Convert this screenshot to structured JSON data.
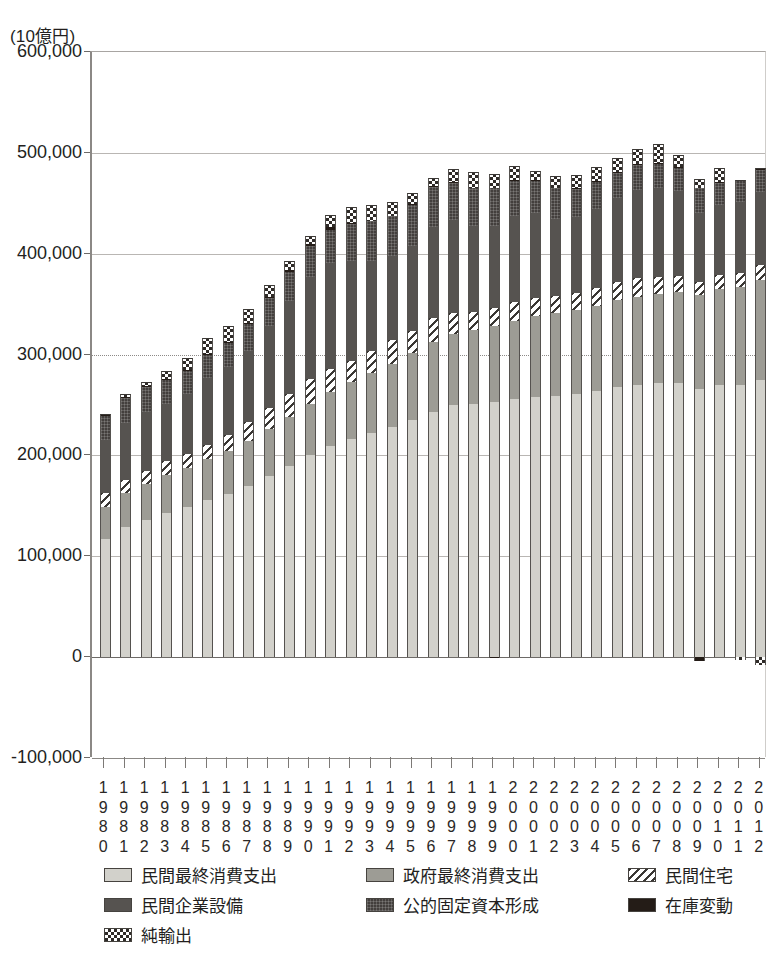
{
  "unit_label": "(10億円)",
  "axis": {
    "y_ticks": [
      "600,000",
      "500,000",
      "400,000",
      "300,000",
      "200,000",
      "100,000",
      "0",
      "-100,000"
    ],
    "y_min": -100000,
    "y_max": 600000,
    "y_step": 100000
  },
  "legend": {
    "items": [
      {
        "key": "private_consumption",
        "label": "民間最終消費支出",
        "swatch": "f-pc",
        "color": "#d2d1cb"
      },
      {
        "key": "government_consumption",
        "label": "政府最終消費支出",
        "swatch": "f-gc",
        "color": "#9d9c95"
      },
      {
        "key": "private_housing",
        "label": "民間住宅",
        "swatch": "f-ph",
        "color": "#3a3734"
      },
      {
        "key": "private_business_investment",
        "label": "民間企業設備",
        "swatch": "f-pi",
        "color": "#565350"
      },
      {
        "key": "public_fixed_capital",
        "label": "公的固定資本形成",
        "swatch": "f-pg",
        "color": "#433f3d"
      },
      {
        "key": "inventory_change",
        "label": "在庫変動",
        "swatch": "f-iv",
        "color": "#241c17"
      },
      {
        "key": "net_exports",
        "label": "純輸出",
        "swatch": "f-nx",
        "color": "#2f2b28"
      }
    ]
  },
  "chart_data": {
    "type": "bar",
    "stacked": true,
    "title": "",
    "xlabel": "",
    "ylabel": "(10億円)",
    "ylim": [
      -100000,
      600000
    ],
    "grid": true,
    "legend_position": "bottom",
    "categories": [
      "1980",
      "1981",
      "1982",
      "1983",
      "1984",
      "1985",
      "1986",
      "1987",
      "1988",
      "1989",
      "1990",
      "1991",
      "1992",
      "1993",
      "1994",
      "1995",
      "1996",
      "1997",
      "1998",
      "1999",
      "2000",
      "2001",
      "2002",
      "2003",
      "2004",
      "2005",
      "2006",
      "2007",
      "2008",
      "2009",
      "2010",
      "2011",
      "2012"
    ],
    "series": [
      {
        "name": "民間最終消費支出",
        "key": "private_consumption",
        "values": [
          117000,
          129000,
          136000,
          143000,
          149000,
          156000,
          162000,
          170000,
          180000,
          190000,
          200000,
          209000,
          216000,
          222000,
          228000,
          235000,
          243000,
          250000,
          251000,
          253000,
          256000,
          258000,
          259000,
          261000,
          264000,
          268000,
          270000,
          272000,
          272000,
          266000,
          270000,
          270000,
          275000
        ]
      },
      {
        "name": "政府最終消費支出",
        "key": "government_consumption",
        "values": [
          32000,
          34000,
          36000,
          38000,
          39000,
          40000,
          42000,
          44000,
          46000,
          48000,
          51000,
          54000,
          57000,
          60000,
          63000,
          67000,
          69000,
          70000,
          73000,
          75000,
          77000,
          80000,
          82000,
          83000,
          84000,
          86000,
          87000,
          88000,
          90000,
          93000,
          95000,
          97000,
          99000
        ]
      },
      {
        "name": "民間住宅",
        "key": "private_housing",
        "values": [
          14000,
          13000,
          13000,
          13000,
          13000,
          14000,
          16000,
          19000,
          21000,
          23000,
          25000,
          23000,
          21000,
          22000,
          23000,
          21000,
          24000,
          21000,
          18000,
          18000,
          19000,
          18000,
          17000,
          17000,
          18000,
          18000,
          19000,
          17000,
          16000,
          13000,
          14000,
          14000,
          15000
        ]
      },
      {
        "name": "民間企業設備",
        "key": "private_business_investment",
        "values": [
          52000,
          56000,
          58000,
          57000,
          60000,
          67000,
          68000,
          71000,
          81000,
          92000,
          101000,
          105000,
          99000,
          89000,
          84000,
          85000,
          90000,
          92000,
          85000,
          81000,
          85000,
          84000,
          76000,
          75000,
          78000,
          83000,
          87000,
          88000,
          84000,
          68000,
          69000,
          70000,
          72000
        ]
      },
      {
        "name": "公的固定資本形成",
        "key": "public_fixed_capital",
        "values": [
          24000,
          25000,
          25000,
          24000,
          23000,
          23000,
          24000,
          27000,
          28000,
          29000,
          31000,
          33000,
          37000,
          39000,
          39000,
          41000,
          40000,
          37000,
          38000,
          38000,
          35000,
          33000,
          31000,
          29000,
          27000,
          26000,
          25000,
          24000,
          23000,
          25000,
          22000,
          22000,
          23000
        ]
      },
      {
        "name": "在庫変動",
        "key": "inventory_change",
        "values": [
          1000,
          1000,
          1000,
          500,
          1000,
          1000,
          500,
          500,
          1500,
          2000,
          2000,
          2000,
          500,
          0,
          0,
          500,
          1000,
          1000,
          0,
          -500,
          1000,
          500,
          0,
          500,
          1000,
          500,
          1000,
          1000,
          1000,
          -4000,
          1000,
          500,
          500
        ]
      },
      {
        "name": "純輸出",
        "key": "net_exports",
        "values": [
          1000,
          3000,
          4000,
          8000,
          12000,
          15000,
          16000,
          14000,
          11000,
          9000,
          8000,
          12000,
          16000,
          16000,
          14000,
          11000,
          8000,
          13000,
          16000,
          14000,
          14000,
          9000,
          12000,
          13000,
          14000,
          13000,
          15000,
          19000,
          12000,
          9000,
          14000,
          -3000,
          -8000
        ]
      }
    ]
  }
}
